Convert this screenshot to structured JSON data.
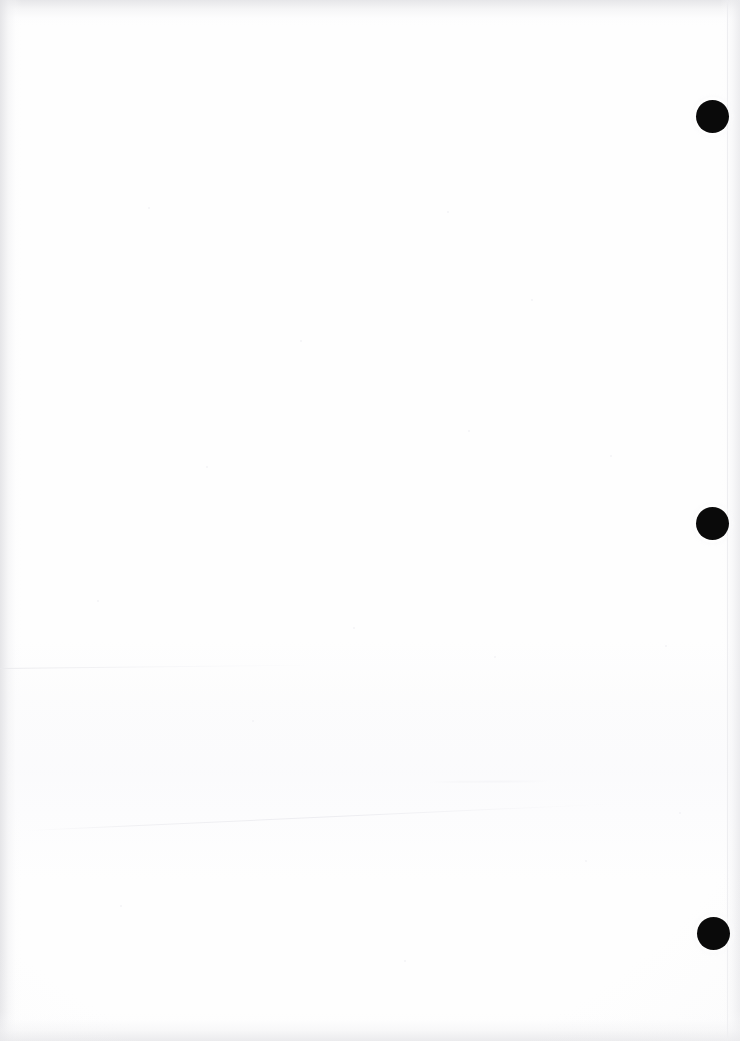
{
  "document": {
    "kind": "scanned-page",
    "page_label": "",
    "body_text": "",
    "note": "blank scanned page, no printed text content"
  },
  "canvas": {
    "width": 740,
    "height": 1041,
    "background_color": "#ffffff",
    "paper_color": "#fefefe"
  },
  "marks": {
    "label": "registration marks",
    "ink_color": "#0a0a0a",
    "items": [
      {
        "name": "registration-mark-top",
        "cx": 712,
        "cy": 116,
        "diameter": 33
      },
      {
        "name": "registration-mark-middle",
        "cx": 712,
        "cy": 523,
        "diameter": 33
      },
      {
        "name": "registration-mark-bottom",
        "cx": 713,
        "cy": 933,
        "diameter": 33
      }
    ]
  },
  "artifacts": {
    "edge_shadow_color": "#e4e4e7",
    "crease_color": "#ececef",
    "page_boundary_x": 727,
    "items": [
      {
        "name": "top-edge-shadow"
      },
      {
        "name": "left-edge-shadow"
      },
      {
        "name": "right-edge-shadow"
      },
      {
        "name": "bottom-edge-shadow"
      },
      {
        "name": "page-boundary-line"
      },
      {
        "name": "upper-crease-line"
      },
      {
        "name": "lower-crease-line"
      },
      {
        "name": "faint-smudge-mark"
      }
    ]
  },
  "speckles": [
    {
      "x": 148,
      "y": 207,
      "s": 2
    },
    {
      "x": 447,
      "y": 211,
      "s": 2
    },
    {
      "x": 531,
      "y": 299,
      "s": 2
    },
    {
      "x": 300,
      "y": 340,
      "s": 2
    },
    {
      "x": 468,
      "y": 430,
      "s": 2
    },
    {
      "x": 206,
      "y": 466,
      "s": 2
    },
    {
      "x": 610,
      "y": 455,
      "s": 2
    },
    {
      "x": 97,
      "y": 600,
      "s": 2
    },
    {
      "x": 353,
      "y": 627,
      "s": 2
    },
    {
      "x": 665,
      "y": 645,
      "s": 2
    },
    {
      "x": 494,
      "y": 656,
      "s": 2
    },
    {
      "x": 252,
      "y": 720,
      "s": 2
    },
    {
      "x": 585,
      "y": 860,
      "s": 2
    },
    {
      "x": 120,
      "y": 905,
      "s": 2
    },
    {
      "x": 404,
      "y": 960,
      "s": 2
    },
    {
      "x": 679,
      "y": 812,
      "s": 2
    }
  ]
}
